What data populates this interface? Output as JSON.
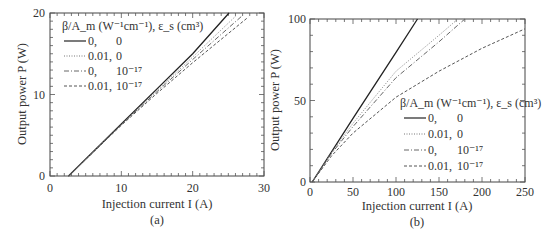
{
  "chart_data": [
    {
      "type": "line",
      "panel_label": "(a)",
      "xlabel": "Injection current I (A)",
      "ylabel": "Output power P (W)",
      "xlim": [
        0,
        30
      ],
      "ylim": [
        0,
        20
      ],
      "xticks": [
        0,
        10,
        20,
        30
      ],
      "yticks": [
        0,
        10,
        20
      ],
      "grid": false,
      "legend": {
        "title": "β/A_m (W⁻¹cm⁻¹), ε_s (cm³)",
        "position": "upper-left",
        "entries": [
          {
            "beta": "0,",
            "eps": "0",
            "style": "solid"
          },
          {
            "beta": "0.01,",
            "eps": "0",
            "style": "dotted"
          },
          {
            "beta": "0,",
            "eps": "10⁻¹⁷",
            "style": "dashdot"
          },
          {
            "beta": "0.01,",
            "eps": "10⁻¹⁷",
            "style": "dashed"
          }
        ]
      },
      "series": [
        {
          "name": "0, 0",
          "style": "solid",
          "x": [
            2.6,
            10,
            15,
            20,
            25.1
          ],
          "y": [
            0,
            6.38,
            10.69,
            15.0,
            20.0
          ]
        },
        {
          "name": "0.01, 0",
          "style": "dotted",
          "x": [
            2.6,
            10,
            15,
            20,
            26.0
          ],
          "y": [
            0,
            6.33,
            10.5,
            14.6,
            19.6
          ]
        },
        {
          "name": "0, 1e-17",
          "style": "dashdot",
          "x": [
            2.6,
            10,
            15,
            20,
            27.0
          ],
          "y": [
            0,
            6.28,
            10.35,
            14.3,
            19.7
          ]
        },
        {
          "name": "0.01, 1e-17",
          "style": "dashed",
          "x": [
            2.6,
            10,
            15,
            20,
            27.8
          ],
          "y": [
            0,
            6.22,
            10.15,
            13.9,
            19.5
          ]
        }
      ]
    },
    {
      "type": "line",
      "panel_label": "(b)",
      "xlabel": "Injection current I (A)",
      "ylabel": "Output power P (W)",
      "xlim": [
        0,
        250
      ],
      "ylim": [
        0,
        100
      ],
      "xticks": [
        0,
        50,
        100,
        150,
        200,
        250
      ],
      "yticks": [
        0,
        50,
        100
      ],
      "grid": false,
      "legend": {
        "title": "β/A_m (W⁻¹cm⁻¹), ε_s (cm³)",
        "position": "lower-right",
        "entries": [
          {
            "beta": "0,",
            "eps": "0",
            "style": "solid"
          },
          {
            "beta": "0.01,",
            "eps": "0",
            "style": "dotted"
          },
          {
            "beta": "0,",
            "eps": "10⁻¹⁷",
            "style": "dashdot"
          },
          {
            "beta": "0.01,",
            "eps": "10⁻¹⁷",
            "style": "dashed"
          }
        ]
      },
      "series": [
        {
          "name": "0, 0",
          "style": "solid",
          "x": [
            2.6,
            50,
            100,
            125
          ],
          "y": [
            0,
            39,
            79.5,
            100
          ]
        },
        {
          "name": "0.01, 0",
          "style": "dotted",
          "x": [
            2.6,
            25,
            50,
            100,
            150,
            172
          ],
          "y": [
            0,
            18,
            36,
            68,
            90,
            100
          ]
        },
        {
          "name": "0, 1e-17",
          "style": "dashdot",
          "x": [
            2.6,
            25,
            50,
            100,
            150,
            180
          ],
          "y": [
            0,
            17.5,
            34,
            64,
            86,
            100
          ]
        },
        {
          "name": "0.01, 1e-17",
          "style": "dashed",
          "x": [
            2.6,
            25,
            50,
            100,
            150,
            200,
            250
          ],
          "y": [
            0,
            16,
            30,
            52,
            68,
            82,
            94
          ]
        }
      ]
    }
  ],
  "panels": {
    "a": {
      "label": "(a)",
      "xlabel": "Injection current I (A)",
      "ylabel": "Output power P (W)",
      "x_tick_labels": [
        "0",
        "10",
        "20",
        "30"
      ],
      "y_tick_labels": [
        "0",
        "10",
        "20"
      ],
      "legend_title": "β/A_m (W⁻¹cm⁻¹), ε_s (cm³)",
      "legend_beta": [
        "0,",
        "0.01,",
        "0,",
        "0.01,"
      ],
      "legend_eps": [
        "0",
        "0",
        "10⁻¹⁷",
        "10⁻¹⁷"
      ]
    },
    "b": {
      "label": "(b)",
      "xlabel": "Injection current I (A)",
      "ylabel": "Output power P (W)",
      "x_tick_labels": [
        "0",
        "50",
        "100",
        "150",
        "200",
        "250"
      ],
      "y_tick_labels": [
        "0",
        "50",
        "100"
      ],
      "legend_title": "β/A_m (W⁻¹cm⁻¹), ε_s (cm³)",
      "legend_beta": [
        "0,",
        "0.01,",
        "0,",
        "0.01,"
      ],
      "legend_eps": [
        "0",
        "0",
        "10⁻¹⁷",
        "10⁻¹⁷"
      ]
    }
  }
}
